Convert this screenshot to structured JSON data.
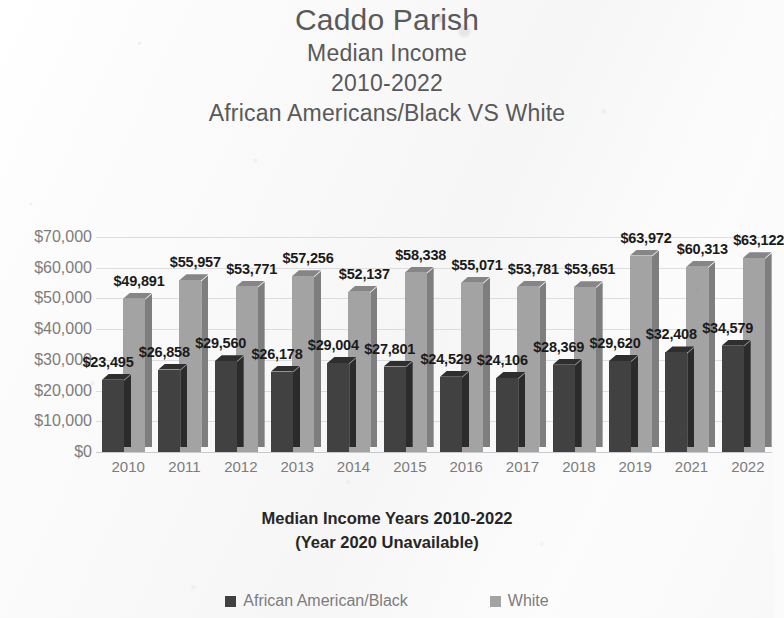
{
  "title": {
    "line1": "Caddo Parish",
    "line2": "Median Income",
    "line3": "2010-2022",
    "line4": "African Americans/Black VS White"
  },
  "xaxis_title": {
    "line1": "Median Income Years 2010-2022",
    "line2": "(Year 2020 Unavailable)"
  },
  "legend": {
    "items": [
      {
        "label": "African American/Black",
        "color": "#414141"
      },
      {
        "label": "White",
        "color": "#a3a3a3"
      }
    ]
  },
  "chart_data": {
    "type": "bar",
    "title": "Caddo Parish Median Income 2010-2022 African Americans/Black VS White",
    "subtitle": "African Americans/Black VS White",
    "xlabel": "Median Income Years 2010-2022 (Year 2020 Unavailable)",
    "ylabel": "",
    "ylim": [
      0,
      70000
    ],
    "ytick_labels": [
      "$70,000",
      "$60,000",
      "$50,000",
      "$40,000",
      "$30,000",
      "$20,000",
      "$10,000",
      "$0"
    ],
    "ytick_values": [
      70000,
      60000,
      50000,
      40000,
      30000,
      20000,
      10000,
      0
    ],
    "grid": true,
    "legend_position": "bottom",
    "three_d": true,
    "categories": [
      "2010",
      "2011",
      "2012",
      "2013",
      "2014",
      "2015",
      "2016",
      "2017",
      "2018",
      "2019",
      "2021",
      "2022"
    ],
    "series": [
      {
        "name": "African American/Black",
        "color": "#414141",
        "values": [
          23495,
          26858,
          29560,
          26178,
          29004,
          27801,
          24529,
          24106,
          28369,
          29620,
          32408,
          34579
        ],
        "labels": [
          "$23,495",
          "$26,858",
          "$29,560",
          "$26,178",
          "$29,004",
          "$27,801",
          "$24,529",
          "$24,106",
          "$28,369",
          "$29,620",
          "$32,408",
          "$34,579"
        ]
      },
      {
        "name": "White",
        "color": "#a3a3a3",
        "values": [
          49891,
          55957,
          53771,
          57256,
          52137,
          58338,
          55071,
          53781,
          53651,
          63972,
          60313,
          63122
        ],
        "labels": [
          "$49,891",
          "$55,957",
          "$53,771",
          "$57,256",
          "$52,137",
          "$58,338",
          "$55,071",
          "$53,781",
          "$53,651",
          "$63,972",
          "$60,313",
          "$63,122"
        ]
      }
    ]
  }
}
